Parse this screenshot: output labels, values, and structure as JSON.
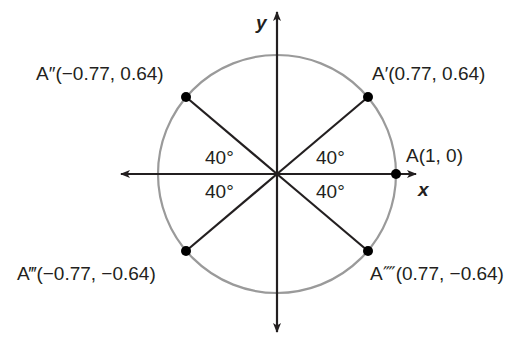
{
  "diagram": {
    "type": "unit-circle",
    "colors": {
      "circle": "#9a9a9a",
      "lines": "#231f20",
      "points": "#000000",
      "text": "#231f20"
    },
    "axes": {
      "x_label": "x",
      "y_label": "y"
    },
    "points": [
      {
        "id": "A",
        "label": "A(1, 0)",
        "x": 1,
        "y": 0
      },
      {
        "id": "A1",
        "label": "A′(0.77, 0.64)",
        "x": 0.77,
        "y": 0.64
      },
      {
        "id": "A2",
        "label": "A″(−0.77, 0.64)",
        "x": -0.77,
        "y": 0.64
      },
      {
        "id": "A3",
        "label": "A‴(−0.77, −0.64)",
        "x": -0.77,
        "y": -0.64
      },
      {
        "id": "A4",
        "label": "A⁗(0.77, −0.64)",
        "x": 0.77,
        "y": -0.64
      }
    ],
    "angles": [
      {
        "quadrant": "I",
        "label": "40°"
      },
      {
        "quadrant": "II",
        "label": "40°"
      },
      {
        "quadrant": "III",
        "label": "40°"
      },
      {
        "quadrant": "IV",
        "label": "40°"
      }
    ]
  }
}
